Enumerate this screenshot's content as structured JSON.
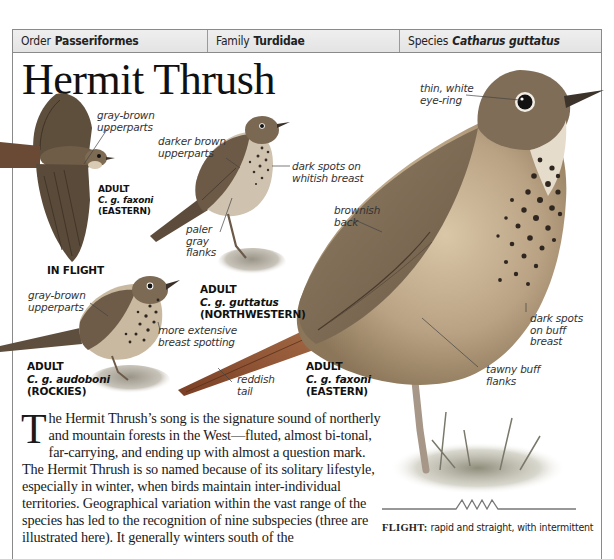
{
  "header": {
    "order_label": "Order",
    "order_value": "Passeriformes",
    "family_label": "Family",
    "family_value": "Turdidae",
    "species_label": "Species",
    "species_value": "Catharus guttatus"
  },
  "title": "Hermit Thrush",
  "annotations": {
    "flight_upperparts": [
      "gray-brown",
      "upperparts"
    ],
    "guttatus_upperparts": [
      "darker brown",
      "upperparts"
    ],
    "guttatus_breast": [
      "dark spots on",
      "whitish breast"
    ],
    "guttatus_flanks": [
      "paler",
      "gray",
      "flanks"
    ],
    "audoboni_upperparts": [
      "gray-brown",
      "upperparts"
    ],
    "audoboni_breast": [
      "more extensive",
      "breast spotting"
    ],
    "faxoni_tail": [
      "reddish",
      "tail"
    ],
    "faxoni_eye": [
      "thin, white",
      "eye-ring"
    ],
    "faxoni_back": [
      "brownish",
      "back"
    ],
    "faxoni_breast": [
      "dark spots",
      "on buff",
      "breast"
    ],
    "faxoni_flanks": [
      "tawny buff",
      "flanks"
    ]
  },
  "subspecies_labels": {
    "flight": {
      "kind": "ADULT",
      "sci": "C. g. faxoni",
      "region": "(EASTERN)",
      "caption": "IN FLIGHT"
    },
    "guttatus": {
      "kind": "ADULT",
      "sci": "C. g. guttatus",
      "region": "(NORTHWESTERN)"
    },
    "audoboni": {
      "kind": "ADULT",
      "sci": "C. g. audoboni",
      "region": "(ROCKIES)"
    },
    "faxoni": {
      "kind": "ADULT",
      "sci": "C. g. faxoni",
      "region": "(EASTERN)"
    }
  },
  "body": {
    "dropcap": "T",
    "text": "he Hermit Thrush’s song is the signature sound of northerly and mountain forests in the West—fluted, almost bi-tonal, far-carrying, and ending up with almost a question mark. The Hermit Thrush is so named because of its solitary lifestyle, especially in winter, when birds maintain inter-individual territories. Geographical variation within the vast range of the species has led to the recognition of nine subspecies (three are illustrated here). It generally winters south of the"
  },
  "flight": {
    "label": "FLIGHT:",
    "text": "rapid and straight, with intermittent"
  },
  "colors": {
    "header_bg": "#e8e8e8",
    "border": "#8a8a8a",
    "bird_brown": "#7d6a52",
    "tail_rufous": "#9a5b3a",
    "breast_buff": "#e8d9bf",
    "spot": "#2e2620"
  }
}
